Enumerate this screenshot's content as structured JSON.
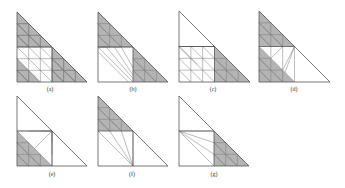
{
  "figure": {
    "colors": {
      "fill": "#b4b4b4",
      "stroke": "#555555",
      "fine": "#7a7a7a",
      "background": "#ffffff"
    },
    "grid_n": 6,
    "panels": [
      {
        "id": "a",
        "label": "(a)",
        "origin": [
          17,
          82
        ],
        "size": 70,
        "label_pos": [
          50,
          86
        ]
      },
      {
        "id": "b",
        "label": "(b)",
        "origin": [
          98,
          82
        ],
        "size": 70,
        "label_pos": [
          133,
          86
        ]
      },
      {
        "id": "c",
        "label": "(c)",
        "origin": [
          179,
          82
        ],
        "size": 71,
        "label_pos": [
          213,
          86
        ]
      },
      {
        "id": "d",
        "label": "(d)",
        "origin": [
          259,
          82
        ],
        "size": 71,
        "label_pos": [
          294,
          86
        ]
      },
      {
        "id": "e",
        "label": "(e)",
        "origin": [
          17,
          166
        ],
        "size": 70,
        "label_pos": [
          52,
          171
        ]
      },
      {
        "id": "f",
        "label": "(f)",
        "origin": [
          98,
          166
        ],
        "size": 70,
        "label_pos": [
          132,
          171
        ]
      },
      {
        "id": "g",
        "label": "(g)",
        "origin": [
          179,
          166
        ],
        "size": 70,
        "label_pos": [
          214,
          171
        ]
      }
    ]
  }
}
